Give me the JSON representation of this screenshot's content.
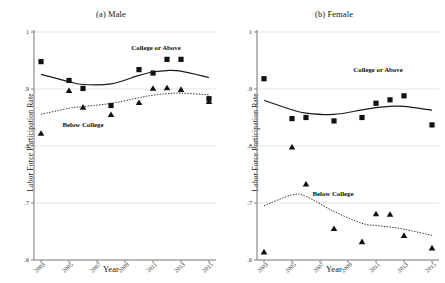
{
  "figure": {
    "background": "#ffffff",
    "marker_color": "#111111",
    "line_color": "#1a1a1a",
    "grid_color": "#d9d9d9",
    "axis_color": "#808080"
  },
  "panels": [
    {
      "id": "male",
      "title": "(a) Male",
      "xlabel": "Year",
      "ylabel": "Labor Force Participation Rate",
      "label_college": "College or Above",
      "label_below": "Below College"
    },
    {
      "id": "female",
      "title": "(b) Female",
      "xlabel": "Year",
      "ylabel": "Labor Force Participation Rate",
      "label_college": "College or Above",
      "label_below": "Below College"
    }
  ],
  "axis": {
    "ytick_labels": [
      "1",
      ".9",
      ".8",
      ".7",
      ".6"
    ],
    "ytick_values": [
      1,
      0.9,
      0.8,
      0.7,
      0.6
    ],
    "xtick_labels": [
      "2003",
      "2005",
      "2007",
      "2009",
      "2011",
      "2013",
      "2015"
    ],
    "xtick_values": [
      2003,
      2005,
      2007,
      2009,
      2011,
      2013,
      2015
    ]
  },
  "chart_data": [
    {
      "type": "scatter",
      "panel": "(a) Male",
      "title": "(a) Male",
      "xlabel": "Year",
      "ylabel": "Labor Force Participation Rate",
      "xlim": [
        2002.5,
        2015.5
      ],
      "ylim": [
        0.6,
        1.0
      ],
      "grid": true,
      "legend": "inline-annotations",
      "series": [
        {
          "name": "College or Above",
          "marker": "square",
          "line_style": "solid",
          "x": [
            2003,
            2005,
            2006,
            2008,
            2010,
            2011,
            2012,
            2013,
            2015
          ],
          "values": [
            0.948,
            0.915,
            0.901,
            0.871,
            0.934,
            0.928,
            0.952,
            0.952,
            0.883
          ]
        },
        {
          "name": "Below College",
          "marker": "triangle",
          "line_style": "dotted",
          "x": [
            2003,
            2005,
            2006,
            2008,
            2010,
            2011,
            2012,
            2013,
            2015
          ],
          "values": [
            0.822,
            0.897,
            0.868,
            0.855,
            0.876,
            0.901,
            0.902,
            0.899,
            0.878
          ]
        }
      ]
    },
    {
      "type": "scatter",
      "panel": "(b) Female",
      "title": "(b) Female",
      "xlabel": "Year",
      "ylabel": "Labor Force Participation Rate",
      "xlim": [
        2002.5,
        2015.5
      ],
      "ylim": [
        0.6,
        1.0
      ],
      "grid": true,
      "legend": "inline-annotations",
      "series": [
        {
          "name": "College or Above",
          "marker": "square",
          "line_style": "solid",
          "x": [
            2003,
            2005,
            2006,
            2008,
            2010,
            2011,
            2012,
            2013,
            2015
          ],
          "values": [
            0.918,
            0.848,
            0.85,
            0.844,
            0.85,
            0.875,
            0.881,
            0.888,
            0.837
          ]
        },
        {
          "name": "Below College",
          "marker": "triangle",
          "line_style": "dotted",
          "x": [
            2003,
            2005,
            2006,
            2008,
            2010,
            2011,
            2012,
            2013,
            2015
          ],
          "values": [
            0.614,
            0.798,
            0.733,
            0.655,
            0.632,
            0.681,
            0.68,
            0.643,
            0.621
          ]
        }
      ]
    }
  ]
}
